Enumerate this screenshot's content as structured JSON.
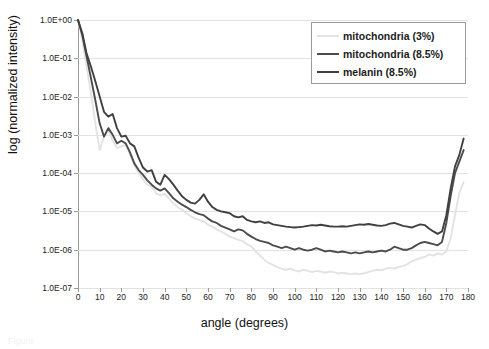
{
  "figure": {
    "caption": "Figure"
  },
  "axes": {
    "x_title": "angle (degrees)",
    "y_title": "log (normalized intensity)",
    "x_ticks": [
      "0",
      "10",
      "20",
      "30",
      "40",
      "50",
      "60",
      "70",
      "80",
      "90",
      "100",
      "110",
      "120",
      "130",
      "140",
      "150",
      "160",
      "170",
      "180"
    ],
    "y_ticks": [
      "1.0E+00",
      "1.0E-01",
      "1.0E-02",
      "1.0E-03",
      "1.0E-04",
      "1.0E-05",
      "1.0E-06",
      "1.0E-07"
    ]
  },
  "legend": {
    "items": [
      {
        "label": "mitochondria (3%)",
        "color": "#e3e3e3"
      },
      {
        "label": "mitochondria (8.5%)",
        "color": "#4c4c4c"
      },
      {
        "label": "melanin (8.5%)",
        "color": "#404040"
      }
    ]
  },
  "chart_data": {
    "type": "line",
    "title": "",
    "xlabel": "angle (degrees)",
    "ylabel": "log (normalized intensity)",
    "xlim": [
      0,
      180
    ],
    "ylim": [
      1e-07,
      1
    ],
    "yscale": "log",
    "grid": true,
    "legend_position": "top-right",
    "x": [
      0,
      2,
      4,
      6,
      8,
      10,
      12,
      14,
      16,
      18,
      20,
      22,
      24,
      26,
      28,
      30,
      32,
      34,
      36,
      38,
      40,
      42,
      44,
      46,
      48,
      50,
      52,
      54,
      56,
      58,
      60,
      62,
      64,
      66,
      68,
      70,
      72,
      74,
      76,
      78,
      80,
      82,
      84,
      86,
      88,
      90,
      92,
      94,
      96,
      98,
      100,
      102,
      104,
      106,
      108,
      110,
      112,
      114,
      116,
      118,
      120,
      122,
      124,
      126,
      128,
      130,
      132,
      134,
      136,
      138,
      140,
      142,
      144,
      146,
      148,
      150,
      152,
      154,
      156,
      158,
      160,
      162,
      164,
      166,
      168,
      170,
      172,
      174,
      176,
      178
    ],
    "series": [
      {
        "name": "mitochondria (3%)",
        "color": "#e3e3e3",
        "values": [
          1.0,
          0.3,
          0.06,
          0.012,
          0.002,
          0.0004,
          0.0009,
          0.0013,
          0.0007,
          0.00045,
          0.0005,
          0.00055,
          0.0003,
          0.00016,
          0.0001,
          7e-05,
          5e-05,
          4.5e-05,
          3e-05,
          2.6e-05,
          2.9e-05,
          2.2e-05,
          1.6e-05,
          1.3e-05,
          1.1e-05,
          9e-06,
          7.5e-06,
          6.5e-06,
          6e-06,
          5.5e-06,
          4.5e-06,
          4e-06,
          3.4e-06,
          3e-06,
          2.6e-06,
          2.2e-06,
          2e-06,
          1.8e-06,
          1.7e-06,
          1.4e-06,
          1.2e-06,
          9e-07,
          7e-07,
          5.5e-07,
          4.5e-07,
          4e-07,
          3.5e-07,
          3.2e-07,
          3e-07,
          3.2e-07,
          2.9e-07,
          2.7e-07,
          3e-07,
          2.8e-07,
          2.6e-07,
          2.8e-07,
          2.7e-07,
          2.5e-07,
          2.7e-07,
          2.6e-07,
          2.4e-07,
          2.5e-07,
          2.4e-07,
          2.3e-07,
          2.4e-07,
          2.3e-07,
          2.4e-07,
          2.6e-07,
          2.8e-07,
          3e-07,
          2.9e-07,
          3.2e-07,
          3.4e-07,
          3.2e-07,
          3.5e-07,
          3.8e-07,
          4.2e-07,
          5e-07,
          5.5e-07,
          6e-07,
          6.5e-07,
          7.5e-07,
          7e-07,
          8e-07,
          7.5e-07,
          9e-07,
          2e-06,
          8e-06,
          3e-05,
          5.8e-05
        ]
      },
      {
        "name": "mitochondria (8.5%)",
        "color": "#4c4c4c",
        "values": [
          1.0,
          0.4,
          0.11,
          0.03,
          0.008,
          0.002,
          0.0009,
          0.0015,
          0.001,
          0.0006,
          0.0007,
          0.0006,
          0.00035,
          0.00018,
          0.00012,
          9e-05,
          6.5e-05,
          5e-05,
          4e-05,
          3.5e-05,
          4e-05,
          3e-05,
          2.2e-05,
          1.8e-05,
          1.5e-05,
          1.3e-05,
          1.1e-05,
          9.5e-06,
          8.5e-06,
          8e-06,
          6.5e-06,
          5.5e-06,
          5e-06,
          4.2e-06,
          3.8e-06,
          3.4e-06,
          3e-06,
          3.4e-06,
          3.2e-06,
          2.6e-06,
          2.2e-06,
          1.9e-06,
          1.7e-06,
          1.6e-06,
          1.5e-06,
          1.3e-06,
          1.2e-06,
          1.1e-06,
          1.2e-06,
          1.1e-06,
          1e-06,
          1.1e-06,
          1e-06,
          9.5e-07,
          1e-06,
          1.1e-06,
          1e-06,
          9e-07,
          9.5e-07,
          9e-07,
          8.5e-07,
          9e-07,
          8.5e-07,
          8e-07,
          8.5e-07,
          8e-07,
          8.5e-07,
          9e-07,
          8.5e-07,
          9e-07,
          9.5e-07,
          9e-07,
          1e-06,
          1.2e-06,
          1.1e-06,
          1e-06,
          1e-06,
          1.1e-06,
          1.3e-06,
          1.5e-06,
          1.6e-06,
          1.5e-06,
          1.4e-06,
          1.3e-06,
          1.6e-06,
          5e-06,
          2.5e-05,
          0.0001,
          0.0002,
          0.0004
        ]
      },
      {
        "name": "melanin (8.5%)",
        "color": "#404040",
        "values": [
          1.0,
          0.45,
          0.13,
          0.06,
          0.025,
          0.01,
          0.004,
          0.003,
          0.0035,
          0.0015,
          0.0009,
          0.00095,
          0.0006,
          0.0005,
          0.00025,
          0.00014,
          0.00011,
          0.00012,
          6e-05,
          5e-05,
          9e-05,
          7e-05,
          5e-05,
          3.5e-05,
          2.5e-05,
          2e-05,
          1.7e-05,
          1.6e-05,
          2e-05,
          2.8e-05,
          1.8e-05,
          1.3e-05,
          1.1e-05,
          1e-05,
          9.5e-06,
          9e-06,
          7.5e-06,
          7e-06,
          7.5e-06,
          6e-06,
          5.5e-06,
          5.2e-06,
          5.5e-06,
          5e-06,
          5.2e-06,
          4.6e-06,
          4.4e-06,
          4.2e-06,
          4e-06,
          3.9e-06,
          3.8e-06,
          3.9e-06,
          4e-06,
          4.2e-06,
          4.4e-06,
          4.3e-06,
          4.5e-06,
          4.3e-06,
          4.1e-06,
          4e-06,
          4e-06,
          4.1e-06,
          4e-06,
          4.2e-06,
          4.4e-06,
          4.6e-06,
          4.5e-06,
          4.7e-06,
          4.5e-06,
          4.3e-06,
          4.2e-06,
          4.4e-06,
          4.8e-06,
          5e-06,
          4.6e-06,
          4.2e-06,
          4e-06,
          3.8e-06,
          4.2e-06,
          4.6e-06,
          4.4e-06,
          3.6e-06,
          3e-06,
          2.6e-06,
          3e-06,
          8e-06,
          4e-05,
          0.00015,
          0.0003,
          0.0008
        ]
      }
    ]
  }
}
